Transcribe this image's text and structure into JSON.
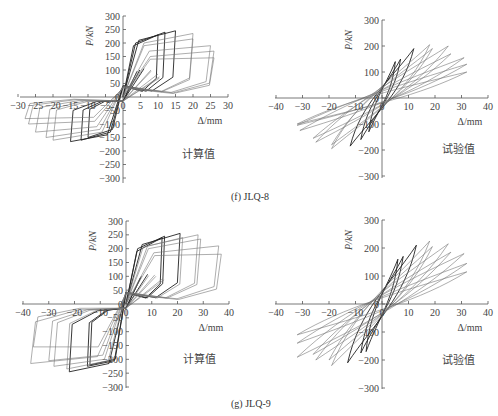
{
  "figure": {
    "captions": [
      {
        "id": "f",
        "text": "(f) JLQ-8",
        "x": 231,
        "y": 191
      },
      {
        "id": "g",
        "text": "(g) JLQ-9",
        "x": 231,
        "y": 398
      }
    ]
  },
  "chart_data": [
    {
      "id": "f-calc",
      "specimen": "JLQ-8",
      "type": "line",
      "subtype": "hysteresis",
      "title": "",
      "annotation": "计算值",
      "xlabel": "Δ/mm",
      "ylabel": "P/kN",
      "xlim": [
        -30,
        30
      ],
      "ylim": [
        -300,
        300
      ],
      "xticks": [
        -30,
        -25,
        -20,
        -15,
        -10,
        -5,
        0,
        5,
        10,
        15,
        20,
        25,
        30
      ],
      "yticks": [
        -300,
        -250,
        -200,
        -150,
        -100,
        -50,
        0,
        50,
        100,
        150,
        200,
        250,
        300
      ],
      "grid": false,
      "style": "polyline",
      "box": {
        "x0": 20,
        "x1": 228,
        "y_top": 16,
        "y_bot": 183,
        "axis_x": 123,
        "axis_y": 97
      },
      "loops": [
        {
          "dmax": 10,
          "pmax": 230,
          "dmin": -10,
          "pmin": -150,
          "py": 190,
          "ny": -120
        },
        {
          "dmax": 12,
          "pmax": 240,
          "dmin": -12,
          "pmin": -160,
          "py": 200,
          "ny": -130
        },
        {
          "dmax": 15,
          "pmax": 245,
          "dmin": -15,
          "pmin": -165,
          "py": 210,
          "ny": -140
        },
        {
          "dmax": 20,
          "pmax": 235,
          "dmin": -20,
          "pmin": -160,
          "py": 200,
          "ny": -130
        },
        {
          "dmax": 20,
          "pmax": 215,
          "dmin": -22,
          "pmin": -150,
          "py": 190,
          "ny": -120
        },
        {
          "dmax": 25,
          "pmax": 190,
          "dmin": -25,
          "pmin": -130,
          "py": 170,
          "ny": -110
        },
        {
          "dmax": 26,
          "pmax": 170,
          "dmin": -27,
          "pmin": -100,
          "py": 150,
          "ny": -90
        },
        {
          "dmax": 26,
          "pmax": 145,
          "dmin": -28,
          "pmin": -80,
          "py": 140,
          "ny": -75
        }
      ]
    },
    {
      "id": "f-test",
      "specimen": "JLQ-8",
      "type": "line",
      "subtype": "hysteresis",
      "title": "",
      "annotation": "试验值",
      "xlabel": "Δ/mm",
      "ylabel": "P/kN",
      "xlim": [
        -40,
        40
      ],
      "ylim": [
        -300,
        300
      ],
      "xticks": [
        -40,
        -30,
        -20,
        -10,
        0,
        10,
        20,
        30,
        40
      ],
      "yticks": [
        -300,
        -200,
        -100,
        0,
        100,
        200,
        300
      ],
      "grid": false,
      "style": "smooth",
      "box": {
        "x0": 275,
        "x1": 488,
        "y_top": 20,
        "y_bot": 178,
        "axis_x": 382,
        "axis_y": 98
      },
      "loops": [
        {
          "dmax": 5,
          "pmax": 140,
          "dmin": -5,
          "pmin": -130,
          "w": 0.25
        },
        {
          "dmax": 7,
          "pmax": 150,
          "dmin": -8,
          "pmin": -160,
          "w": 0.3
        },
        {
          "dmax": 12,
          "pmax": 190,
          "dmin": -12,
          "pmin": -185,
          "w": 0.35
        },
        {
          "dmax": 18,
          "pmax": 205,
          "dmin": -19,
          "pmin": -195,
          "w": 0.45
        },
        {
          "dmax": 19,
          "pmax": 190,
          "dmin": -19,
          "pmin": -180,
          "w": 0.5
        },
        {
          "dmax": 25,
          "pmax": 200,
          "dmin": -25,
          "pmin": -170,
          "w": 0.55
        },
        {
          "dmax": 26,
          "pmax": 170,
          "dmin": -26,
          "pmin": -155,
          "w": 0.6
        },
        {
          "dmax": 31,
          "pmax": 155,
          "dmin": -31,
          "pmin": -125,
          "w": 0.6
        },
        {
          "dmax": 32,
          "pmax": 130,
          "dmin": -32,
          "pmin": -105,
          "w": 0.6
        },
        {
          "dmax": 32,
          "pmax": 100,
          "dmin": -32,
          "pmin": -100,
          "w": 0.55
        }
      ]
    },
    {
      "id": "g-calc",
      "specimen": "JLQ-9",
      "type": "line",
      "subtype": "hysteresis",
      "title": "",
      "annotation": "计算值",
      "xlabel": "Δ/mm",
      "ylabel": "P/kN",
      "xlim": [
        -40,
        40
      ],
      "ylim": [
        -300,
        300
      ],
      "xticks": [
        -40,
        -30,
        -20,
        -10,
        0,
        10,
        20,
        30,
        40
      ],
      "yticks": [
        -300,
        -250,
        -200,
        -150,
        -100,
        -50,
        0,
        50,
        100,
        150,
        200,
        250,
        300
      ],
      "grid": false,
      "style": "polyline",
      "box": {
        "x0": 22,
        "x1": 229,
        "y_top": 221,
        "y_bot": 388,
        "axis_x": 126,
        "axis_y": 304
      },
      "loops": [
        {
          "dmax": 14,
          "pmax": 240,
          "dmin": -14,
          "pmin": -220,
          "py": 190,
          "ny": -200
        },
        {
          "dmax": 15,
          "pmax": 245,
          "dmin": -15,
          "pmin": -225,
          "py": 200,
          "ny": -205
        },
        {
          "dmax": 21,
          "pmax": 255,
          "dmin": -22,
          "pmin": -245,
          "py": 215,
          "ny": -215
        },
        {
          "dmax": 22,
          "pmax": 240,
          "dmin": -23,
          "pmin": -235,
          "py": 205,
          "ny": -205
        },
        {
          "dmax": 28,
          "pmax": 250,
          "dmin": -28,
          "pmin": -225,
          "py": 210,
          "ny": -200
        },
        {
          "dmax": 29,
          "pmax": 235,
          "dmin": -30,
          "pmin": -205,
          "py": 200,
          "ny": -185
        },
        {
          "dmax": 36,
          "pmax": 210,
          "dmin": -37,
          "pmin": -215,
          "py": 185,
          "ny": -190
        },
        {
          "dmax": 37,
          "pmax": 180,
          "dmin": -36,
          "pmin": -155,
          "py": 175,
          "ny": -155
        }
      ]
    },
    {
      "id": "g-test",
      "specimen": "JLQ-9",
      "type": "line",
      "subtype": "hysteresis",
      "title": "",
      "annotation": "试验值",
      "xlabel": "Δ/mm",
      "ylabel": "P/kN",
      "xlim": [
        -40,
        40
      ],
      "ylim": [
        -300,
        300
      ],
      "xticks": [
        -40,
        -30,
        -20,
        -10,
        0,
        10,
        20,
        30,
        40
      ],
      "yticks": [
        -300,
        -200,
        -100,
        0,
        100,
        200,
        300
      ],
      "grid": false,
      "style": "smooth",
      "box": {
        "x0": 275,
        "x1": 488,
        "y_top": 220,
        "y_bot": 389,
        "axis_x": 382,
        "axis_y": 304
      },
      "loops": [
        {
          "dmax": 6,
          "pmax": 160,
          "dmin": -6,
          "pmin": -170,
          "w": 0.25
        },
        {
          "dmax": 8,
          "pmax": 170,
          "dmin": -8,
          "pmin": -175,
          "w": 0.3
        },
        {
          "dmax": 13,
          "pmax": 210,
          "dmin": -13,
          "pmin": -210,
          "w": 0.35
        },
        {
          "dmax": 18,
          "pmax": 225,
          "dmin": -19,
          "pmin": -220,
          "w": 0.45
        },
        {
          "dmax": 19,
          "pmax": 205,
          "dmin": -20,
          "pmin": -200,
          "w": 0.5
        },
        {
          "dmax": 25,
          "pmax": 215,
          "dmin": -25,
          "pmin": -200,
          "w": 0.55
        },
        {
          "dmax": 26,
          "pmax": 185,
          "dmin": -26,
          "pmin": -180,
          "w": 0.6
        },
        {
          "dmax": 31,
          "pmax": 180,
          "dmin": -32,
          "pmin": -190,
          "w": 0.6
        },
        {
          "dmax": 32,
          "pmax": 145,
          "dmin": -32,
          "pmin": -140,
          "w": 0.6
        },
        {
          "dmax": 32,
          "pmax": 115,
          "dmin": -32,
          "pmin": -110,
          "w": 0.55
        }
      ]
    }
  ],
  "colors": {
    "axis": "#555555",
    "curve_dark": "#222222",
    "curve_light": "#777777",
    "text": "#444444"
  }
}
